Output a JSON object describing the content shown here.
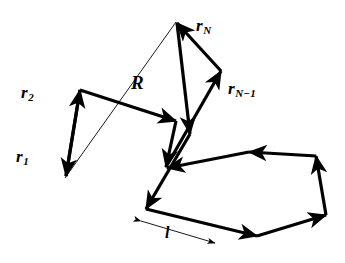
{
  "figure": {
    "type": "diagram",
    "background_color": "#ffffff",
    "stroke_color": "#000000",
    "chain_stroke_width": 3.2,
    "vector_stroke_width": 0.9,
    "canvas": {
      "width": 345,
      "height": 263
    }
  },
  "labels": {
    "r1": {
      "base": "r",
      "sub": "1"
    },
    "r2": {
      "base": "r",
      "sub": "2"
    },
    "R": {
      "base": "R",
      "sub": ""
    },
    "rN": {
      "base": "r",
      "sub": "N"
    },
    "rNm1": {
      "base": "r",
      "sub": "N−1"
    },
    "l": {
      "base": "l",
      "sub": ""
    }
  },
  "geometry": {
    "chain_path": "M 65,178 L 80,90 L 176,122 L 166,168 L 222,70 L 176,22 L 190,135 L 145,210 L 258,237 L 327,215 L 316,155 L 249,151 L 166,168",
    "end_to_end_vector": {
      "x1": 65,
      "y1": 178,
      "x2": 176,
      "y2": 22
    },
    "dimension_line": {
      "x1": 141,
      "y1": 221,
      "x2": 215,
      "y2": 243
    },
    "dimension_tick": {
      "x1": 172,
      "y1": 224,
      "x2": 178,
      "y2": 243
    }
  }
}
